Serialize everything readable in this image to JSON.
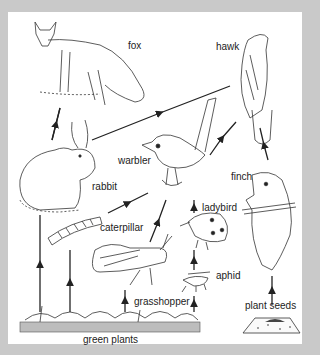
{
  "diagram": {
    "type": "food-web",
    "background": "#c9c9c9",
    "panel_color": "#ffffff",
    "ink_color": "#222222",
    "nodes": [
      {
        "id": "fox",
        "label": "fox"
      },
      {
        "id": "hawk",
        "label": "hawk"
      },
      {
        "id": "rabbit",
        "label": "rabbit"
      },
      {
        "id": "warbler",
        "label": "warbler"
      },
      {
        "id": "finch",
        "label": "finch"
      },
      {
        "id": "ladybird",
        "label": "ladybird"
      },
      {
        "id": "caterpillar",
        "label": "caterpillar"
      },
      {
        "id": "aphid",
        "label": "aphid"
      },
      {
        "id": "grasshopper",
        "label": "grasshopper"
      },
      {
        "id": "plant_seeds",
        "label": "plant seeds"
      },
      {
        "id": "green_plants",
        "label": "green plants"
      }
    ],
    "edges": [
      {
        "from": "rabbit",
        "to": "fox"
      },
      {
        "from": "rabbit",
        "to": "hawk"
      },
      {
        "from": "warbler",
        "to": "hawk"
      },
      {
        "from": "finch",
        "to": "hawk"
      },
      {
        "from": "caterpillar",
        "to": "warbler"
      },
      {
        "from": "grasshopper",
        "to": "warbler"
      },
      {
        "from": "ladybird",
        "to": "warbler"
      },
      {
        "from": "aphid",
        "to": "ladybird"
      },
      {
        "from": "green_plants",
        "to": "rabbit"
      },
      {
        "from": "green_plants",
        "to": "caterpillar"
      },
      {
        "from": "green_plants",
        "to": "grasshopper"
      },
      {
        "from": "green_plants",
        "to": "aphid"
      },
      {
        "from": "plant_seeds",
        "to": "finch"
      }
    ]
  }
}
